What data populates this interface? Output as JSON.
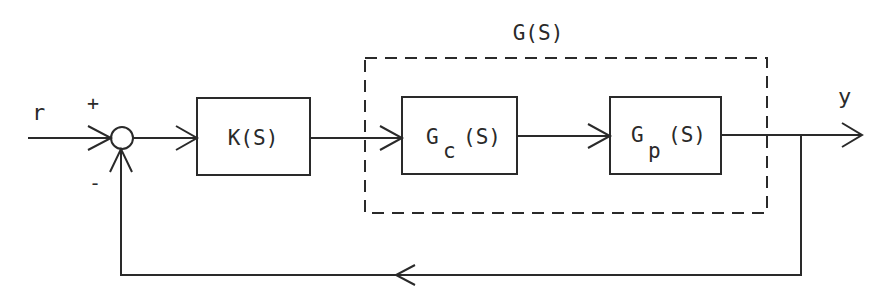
{
  "diagram": {
    "type": "control-block-diagram",
    "colors": {
      "ink": "#2a2a2a",
      "background": "#ffffff"
    },
    "input_label": "r",
    "output_label": "y",
    "summing_junction": {
      "plus_sign": "+",
      "minus_sign": "-"
    },
    "blocks": [
      {
        "id": "controller",
        "label": "K(S)"
      },
      {
        "id": "compensator",
        "label_main": "G",
        "label_sub": "c",
        "label_arg": "(S)"
      },
      {
        "id": "plant",
        "label_main": "G",
        "label_sub": "p",
        "label_arg": "(S)"
      }
    ],
    "group": {
      "label": "G(S)",
      "contains": [
        "compensator",
        "plant"
      ],
      "style": "dashed"
    },
    "edges": [
      {
        "from": "r",
        "to": "summing_junction",
        "sign": "+"
      },
      {
        "from": "summing_junction",
        "to": "controller"
      },
      {
        "from": "controller",
        "to": "compensator"
      },
      {
        "from": "compensator",
        "to": "plant"
      },
      {
        "from": "plant",
        "to": "y"
      },
      {
        "from": "y",
        "to": "summing_junction",
        "sign": "-",
        "kind": "feedback"
      }
    ]
  }
}
